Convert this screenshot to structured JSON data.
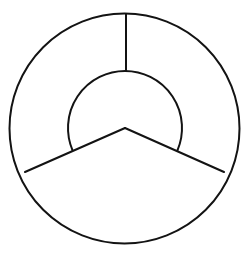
{
  "canvas": {
    "width": 251,
    "height": 262,
    "background_color": "#ffffff"
  },
  "figure": {
    "stroke_color": "#131313",
    "stroke_width": 2,
    "fill": "none"
  },
  "chart_data": {
    "type": "pie",
    "subtitle": "",
    "xlabel": "",
    "ylabel": "",
    "grid": false,
    "legend": "none",
    "center": {
      "x": 125,
      "y": 128
    },
    "outer_circle": {
      "label": "outer-circle",
      "center_x": 124.5,
      "center_y": 128.5,
      "radius": 115,
      "top_y": 13.5,
      "bottom_y": 243.5,
      "left_x": 9.5,
      "right_x": 239.5
    },
    "inner_circle": {
      "label": "inner-circle",
      "center_x": 125,
      "center_y": 128,
      "radius": 57,
      "top_y": 71,
      "bottom_y": 185,
      "left_x": 68,
      "right_x": 182,
      "arc_gap_start_deg": 203,
      "arc_gap_end_deg": 337,
      "arc_drawn_sweep_deg": 226
    },
    "radii": [
      {
        "label": "radius-top",
        "angle_deg": 90,
        "inner_x": 126,
        "inner_y": 71,
        "outer_x": 126,
        "outer_y": 14,
        "length": 57
      },
      {
        "label": "radius-lower-left",
        "angle_deg": 203,
        "inner_x": 125,
        "inner_y": 128,
        "outer_x": 25,
        "outer_y": 172,
        "length": 115
      },
      {
        "label": "radius-lower-right",
        "angle_deg": 337,
        "inner_x": 125,
        "inner_y": 128,
        "outer_x": 224,
        "outer_y": 172,
        "length": 115
      }
    ],
    "categories": [
      "upper-left-annulus-sector",
      "upper-right-annulus-sector",
      "bottom-full-sector"
    ],
    "values": [
      113,
      113,
      134
    ],
    "ylim": [
      0,
      360
    ]
  }
}
